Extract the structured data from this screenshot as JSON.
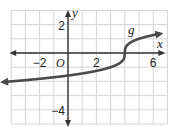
{
  "chart_data": {
    "type": "line",
    "title": "",
    "xlabel": "x",
    "ylabel": "y",
    "function_label": "g",
    "function_expression": "g(x) = cbrt(x - 4)",
    "xlim": [
      -4,
      7
    ],
    "ylim": [
      -5,
      3
    ],
    "grid": true,
    "x_tick_labels": [
      {
        "value": -2,
        "label": "−2"
      },
      {
        "value": 2,
        "label": "2"
      },
      {
        "value": 6,
        "label": "6"
      }
    ],
    "y_tick_labels": [
      {
        "value": 2,
        "label": "2"
      },
      {
        "value": -4,
        "label": "−4"
      }
    ],
    "origin_label": "O",
    "series": [
      {
        "name": "g",
        "arrows": "both",
        "x": [
          -4.5,
          -4,
          -3,
          -2,
          -1,
          0,
          1,
          2,
          3,
          3.5,
          3.8,
          3.95,
          4,
          4.05,
          4.2,
          4.5,
          5,
          6,
          6.5
        ],
        "y": [
          -2.04,
          -2.0,
          -1.91,
          -1.82,
          -1.71,
          -1.59,
          -1.44,
          -1.26,
          -1.0,
          -0.79,
          -0.58,
          -0.37,
          0,
          0.37,
          0.58,
          0.79,
          1.0,
          1.26,
          1.36
        ]
      }
    ]
  },
  "colors": {
    "curve": "#4a4a4a",
    "axis": "#333333",
    "grid": "#d4d4d4",
    "background": "#ffffff"
  }
}
